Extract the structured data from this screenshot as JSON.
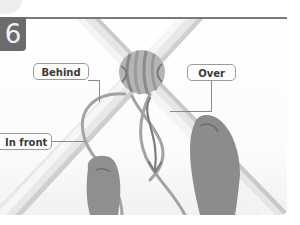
{
  "figure": {
    "step_number": "6",
    "labels": {
      "behind": "Behind",
      "over": "Over",
      "in_front": "In front"
    },
    "colors": {
      "badge": "#6b6b6b",
      "rule": "#7a7a7a",
      "pole": "#e3e3e3",
      "rope": "#a8a8a8",
      "hand": "#8c8c8c",
      "label_border": "#9a9a9a"
    }
  }
}
